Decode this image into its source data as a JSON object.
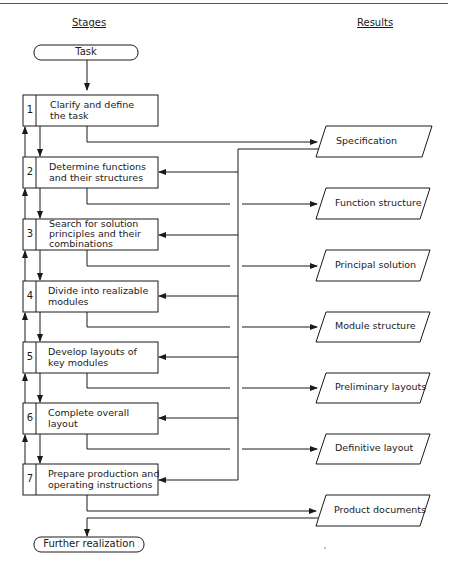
{
  "headers": {
    "stages": "Stages",
    "results": "Results"
  },
  "start": "Task",
  "end": "Further realization",
  "stages": [
    {
      "num": "1",
      "line1": "Clarify and define",
      "line2": "the task",
      "line3": ""
    },
    {
      "num": "2",
      "line1": "Determine functions",
      "line2": "and their structures",
      "line3": ""
    },
    {
      "num": "3",
      "line1": "Search for solution",
      "line2": "principles and their",
      "line3": "combinations"
    },
    {
      "num": "4",
      "line1": "Divide into realizable",
      "line2": "modules",
      "line3": ""
    },
    {
      "num": "5",
      "line1": "Develop layouts of",
      "line2": "key modules",
      "line3": ""
    },
    {
      "num": "6",
      "line1": "Complete overall",
      "line2": "layout",
      "line3": ""
    },
    {
      "num": "7",
      "line1": "Prepare production and",
      "line2": "operating instructions",
      "line3": ""
    }
  ],
  "results": [
    "Specification",
    "Function structure",
    "Principal solution",
    "Module structure",
    "Preliminary layouts",
    "Definitive layout",
    "Product documents"
  ]
}
